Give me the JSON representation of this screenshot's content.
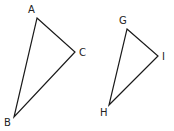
{
  "diagram": {
    "triangles": [
      {
        "name": "ABC",
        "vertices": [
          {
            "label": "A",
            "x": 37,
            "y": 18,
            "label_x": 28,
            "label_y": 13
          },
          {
            "label": "C",
            "x": 75,
            "y": 52,
            "label_x": 79,
            "label_y": 56
          },
          {
            "label": "B",
            "x": 14,
            "y": 117,
            "label_x": 4,
            "label_y": 126
          }
        ]
      },
      {
        "name": "GHI",
        "vertices": [
          {
            "label": "G",
            "x": 127,
            "y": 29,
            "label_x": 119,
            "label_y": 24
          },
          {
            "label": "I",
            "x": 158,
            "y": 56,
            "label_x": 162,
            "label_y": 60
          },
          {
            "label": "H",
            "x": 109,
            "y": 105,
            "label_x": 100,
            "label_y": 116
          }
        ]
      }
    ],
    "stroke_color": "#1a1a1a",
    "label_color": "#222222"
  }
}
